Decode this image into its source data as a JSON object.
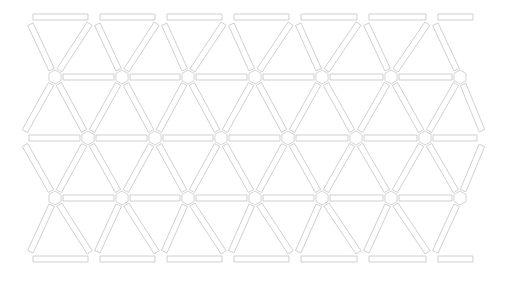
{
  "diagram": {
    "stroke_color": "#c9c9c9",
    "background": "#ffffff",
    "grid": {
      "rows": [
        {
          "y": 17,
          "x": [
            27,
            94,
            161,
            228,
            295,
            363,
            432,
            479
          ],
          "role": "top-edge"
        },
        {
          "y": 77,
          "x": [
            55,
            122,
            188,
            255,
            322,
            391,
            460
          ],
          "role": "interior"
        },
        {
          "y": 138,
          "x": [
            21,
            88,
            155,
            221,
            288,
            356,
            425,
            485
          ],
          "role": "interior"
        },
        {
          "y": 198,
          "x": [
            55,
            122,
            188,
            255,
            322,
            391,
            460
          ],
          "role": "interior"
        },
        {
          "y": 259,
          "x": [
            27,
            94,
            161,
            228,
            295,
            363,
            432,
            479
          ],
          "role": "bottom-edge"
        }
      ],
      "bar_width": 6,
      "joint_radius": 7,
      "edge_gap": 3
    }
  }
}
